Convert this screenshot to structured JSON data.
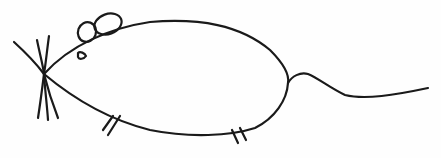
{
  "drawing": {
    "subject": "mouse",
    "style": "hand-drawn line art",
    "colors": {
      "background": "#fefefe",
      "ink": "#1a1a1a"
    },
    "parts": [
      "whiskers",
      "body",
      "ears",
      "eye",
      "front-legs",
      "back-legs",
      "tail"
    ]
  }
}
